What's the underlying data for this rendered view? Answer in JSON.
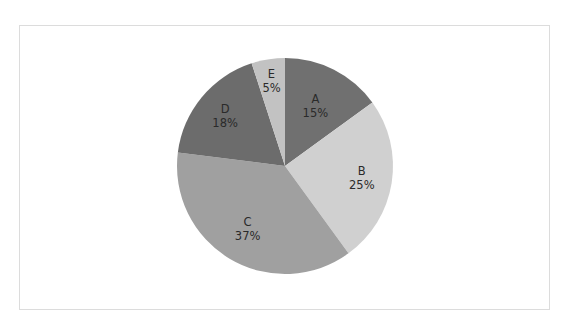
{
  "chart_data": {
    "type": "pie",
    "title": "",
    "start_angle": "12 o'clock",
    "direction": "clockwise",
    "categories": [
      "A",
      "B",
      "C",
      "D",
      "E"
    ],
    "values": [
      15,
      25,
      37,
      18,
      5
    ],
    "unit": "%",
    "slices": [
      {
        "label": "A",
        "value": 15,
        "value_label": "15%",
        "color": "#707070"
      },
      {
        "label": "B",
        "value": 25,
        "value_label": "25%",
        "color": "#d0d0d0"
      },
      {
        "label": "C",
        "value": 37,
        "value_label": "37%",
        "color": "#a0a0a0"
      },
      {
        "label": "D",
        "value": 18,
        "value_label": "18%",
        "color": "#6c6c6c"
      },
      {
        "label": "E",
        "value": 5,
        "value_label": "5%",
        "color": "#c2c2c2"
      }
    ],
    "legend": "none",
    "labels_inside": true
  },
  "layout": {
    "center": [
      285,
      166
    ],
    "radius": 108,
    "label_radius": [
      0.62,
      0.72,
      0.68,
      0.72,
      0.8
    ]
  }
}
